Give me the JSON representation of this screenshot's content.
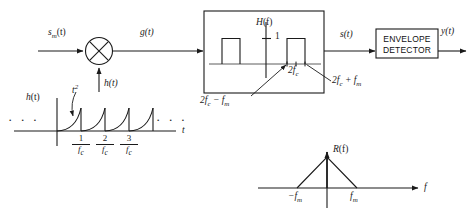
{
  "diagram": {
    "title_hidden": "",
    "signals": {
      "input": "s_m(t)",
      "input_base": "s",
      "input_sub": "m",
      "input_tail": "(t)",
      "mixer_output": "g(t)",
      "local_input": "h(t)",
      "filter_output": "s(t)",
      "final_output": "y(t)"
    },
    "mixer": {
      "name": "multiplier",
      "glyph": "×"
    },
    "filter_block": {
      "axis_label_base": "H",
      "axis_label_arg": "(f)",
      "gain_label": "1",
      "center_base": "2f",
      "center_sub": "c",
      "lower_edge_base": "2f",
      "lower_edge_sub": "c",
      "lower_edge_tail": " − f",
      "lower_edge_sub2": "m",
      "upper_edge_base": "2f",
      "upper_edge_sub": "c",
      "upper_edge_tail": " + f",
      "upper_edge_sub2": "m"
    },
    "detector": {
      "line1": "ENVELOPE",
      "line2": "DETECTOR"
    },
    "impulse_response": {
      "label_base": "h",
      "label_arg": "(t)",
      "curve_annotation_base": "t",
      "curve_annotation_exp": "2",
      "axis_label": "t",
      "left_ellipsis": "· · ·",
      "right_ellipsis": "· · ·",
      "ticks": [
        {
          "num": "1",
          "den_base": "f",
          "den_sub": "c"
        },
        {
          "num": "2",
          "den_base": "f",
          "den_sub": "c"
        },
        {
          "num": "3",
          "den_base": "f",
          "den_sub": "c"
        }
      ]
    },
    "spectrum": {
      "label_base": "R",
      "label_arg": "(f)",
      "axis_label": "f",
      "left_tick_base": "−f",
      "left_tick_sub": "m",
      "right_tick_base": "f",
      "right_tick_sub": "m"
    },
    "colors": {
      "line": "#1a1a1a",
      "text": "#1a1a1a",
      "background": "#ffffff"
    }
  }
}
